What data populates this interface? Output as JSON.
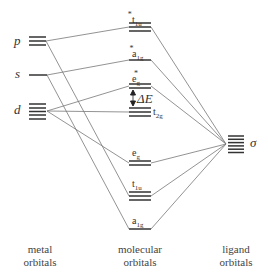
{
  "figure": {
    "type": "molecular orbital energy-level diagram (octahedral complex, sigma bonding)",
    "columns": {
      "metal": {
        "line1": "metal",
        "line2": "orbitals"
      },
      "molecular": {
        "line1": "molecular",
        "line2": "orbitals"
      },
      "ligand": {
        "line1": "ligand",
        "line2": "orbitals"
      }
    },
    "metal_levels": [
      {
        "id": "p",
        "label": "p",
        "degeneracy": 3
      },
      {
        "id": "s",
        "label": "s",
        "degeneracy": 1
      },
      {
        "id": "d",
        "label": "d",
        "degeneracy": 5
      }
    ],
    "molecular_levels": [
      {
        "id": "t1u_star",
        "base": "t",
        "sub": "1u",
        "star": "*",
        "degeneracy": 3
      },
      {
        "id": "a1g_star",
        "base": "a",
        "sub": "1g",
        "star": "*",
        "degeneracy": 1
      },
      {
        "id": "eg_star",
        "base": "e",
        "sub": "g",
        "star": "*",
        "degeneracy": 2
      },
      {
        "id": "t2g",
        "base": "t",
        "sub": "2g",
        "star": "",
        "degeneracy": 3
      },
      {
        "id": "eg",
        "base": "e",
        "sub": "g",
        "star": "",
        "degeneracy": 2
      },
      {
        "id": "t1u",
        "base": "t",
        "sub": "1u",
        "star": "",
        "degeneracy": 3
      },
      {
        "id": "a1g",
        "base": "a",
        "sub": "1g",
        "star": "",
        "degeneracy": 1
      }
    ],
    "ligand_levels": [
      {
        "id": "sigma",
        "label": "σ",
        "degeneracy": 6
      }
    ],
    "splitting_label": "ΔE",
    "connections": [
      [
        "p",
        "t1u_star"
      ],
      [
        "p",
        "t1u"
      ],
      [
        "s",
        "a1g_star"
      ],
      [
        "s",
        "a1g"
      ],
      [
        "d",
        "eg_star"
      ],
      [
        "d",
        "t2g"
      ],
      [
        "d",
        "eg"
      ],
      [
        "sigma",
        "t1u_star"
      ],
      [
        "sigma",
        "a1g_star"
      ],
      [
        "sigma",
        "eg_star"
      ],
      [
        "sigma",
        "eg"
      ],
      [
        "sigma",
        "t1u"
      ],
      [
        "sigma",
        "a1g"
      ]
    ]
  }
}
